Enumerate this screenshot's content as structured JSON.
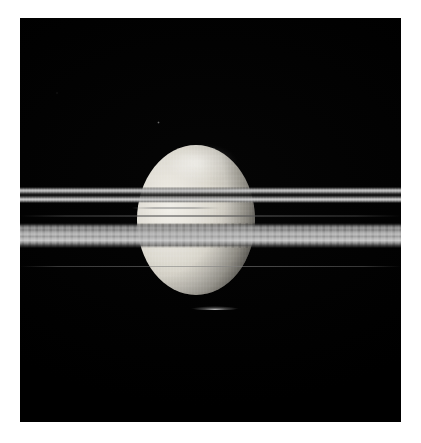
{
  "image": {
    "kind": "astronomical-photograph",
    "subject": "Saturn globe bisected by its edge-on ring plane",
    "frame_background_color": "#000000",
    "page_background_color": "#ffffff",
    "caption": ""
  },
  "plate": {
    "border_color": "#ffffff",
    "left_margin_px": 20,
    "top_margin_px": 18,
    "width_px": 381,
    "height_px": 404
  },
  "features": [
    {
      "name": "saturn-globe",
      "label": "Saturn disc",
      "center_x_px": 176,
      "center_y_px": 202,
      "width_px": 118,
      "height_px": 150,
      "highlight_color": "#f2f0ea",
      "shadow_color": "#0a0a0a",
      "description": "Bright cream-white globe lit from upper left, terminator shading toward the lower right limb"
    },
    {
      "name": "ring-upper",
      "label": "Upper bright ring pair",
      "top_px": 169,
      "height_px": 16,
      "color": "#c6c6c6",
      "description": "Two narrow bright ring lines separated by a dark gap, spanning the full frame width"
    },
    {
      "name": "ring-gap-line",
      "label": "Faint ring line in the gap",
      "top_px": 197,
      "height_px": 2,
      "color": "#565656"
    },
    {
      "name": "ring-lower",
      "label": "Lower broad ring belt",
      "top_px": 205,
      "height_px": 25,
      "color": "#bababa",
      "description": "Wide multi-banded grey belt with vertical scan texture, spanning the full frame width"
    },
    {
      "name": "ring-faint-lower",
      "label": "Faint outer ring streak",
      "top_px": 248,
      "height_px": 1,
      "color": "#828282"
    },
    {
      "name": "ring-shadow-streak",
      "label": "Ring shadow streak on globe",
      "top_px": 189,
      "height_px": 2,
      "color": "#8c8c8c"
    },
    {
      "name": "limb-arc",
      "label": "Bright limb arc below globe",
      "top_px": 288,
      "color": "#ebebeb"
    },
    {
      "name": "star-speck",
      "label": "Faint point source",
      "x_px": 137,
      "y_px": 103,
      "color": "#7d7d7d"
    }
  ],
  "palette": {
    "space_black": "#000000",
    "ring_bright": "#cecece",
    "ring_mid": "#a8a8a8",
    "ring_dark": "#242424",
    "globe_highlight": "#f2f0ea",
    "globe_midtone": "#a9a69d",
    "globe_shadow": "#1d1d1c",
    "border_white": "#ffffff"
  }
}
